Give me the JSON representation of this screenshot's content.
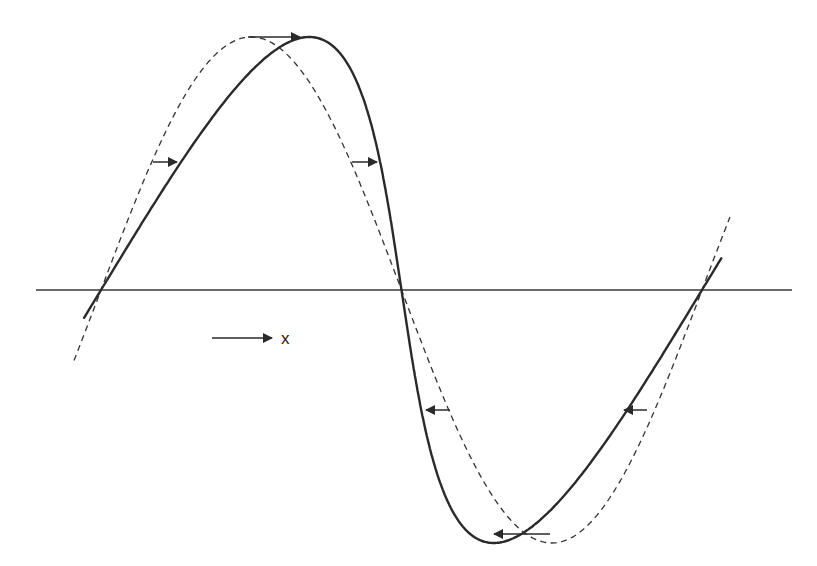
{
  "diagram": {
    "type": "waveform-steepening",
    "direction_indicator": {
      "label": "x"
    },
    "colors": {
      "stroke": "#2a2a2a",
      "background": "#ffffff"
    },
    "axis": {
      "y": 290,
      "x_start": 36,
      "x_end": 792
    },
    "curves": [
      {
        "name": "initial-sinusoid",
        "style": "dashed",
        "peak": [
          248,
          37
        ],
        "trough": [
          550,
          534
        ],
        "zero_crossings": [
          101,
          401,
          702
        ]
      },
      {
        "name": "steepened-wave",
        "style": "solid",
        "peak": [
          305,
          37
        ],
        "trough": [
          490,
          534
        ],
        "zero_crossings": [
          101,
          401,
          702
        ]
      }
    ],
    "shift_arrows": [
      {
        "from": [
          248,
          37
        ],
        "to": [
          302,
          37
        ],
        "direction": "right"
      },
      {
        "from": [
          153,
          162
        ],
        "to": [
          177,
          162
        ],
        "direction": "right"
      },
      {
        "from": [
          352,
          162
        ],
        "to": [
          377,
          162
        ],
        "direction": "right"
      },
      {
        "from": [
          450,
          410
        ],
        "to": [
          426,
          410
        ],
        "direction": "left"
      },
      {
        "from": [
          647,
          410
        ],
        "to": [
          624,
          410
        ],
        "direction": "left"
      },
      {
        "from": [
          550,
          534
        ],
        "to": [
          494,
          534
        ],
        "direction": "left"
      }
    ]
  }
}
